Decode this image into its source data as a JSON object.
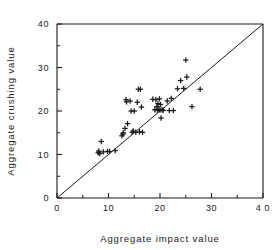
{
  "chart_data": {
    "type": "scatter",
    "title": "",
    "xlabel": "Aggregate  impact  value",
    "ylabel": "Aggregate  crushing  value",
    "xlim": [
      0,
      40
    ],
    "ylim": [
      0,
      40
    ],
    "xticks": [
      0,
      10,
      20,
      30,
      40
    ],
    "yticks": [
      0,
      10,
      20,
      30,
      40
    ],
    "xtick_labels": [
      "0",
      "10",
      "20",
      "30",
      "4 0"
    ],
    "ytick_labels": [
      "0",
      "10",
      "20",
      "30",
      "40"
    ],
    "minor_ticks": true,
    "minor_tick_step": 5,
    "grid": false,
    "legend": null,
    "marker": "plus",
    "marker_color": "#1a1a1a",
    "reference_line": {
      "name": "line-of-equality",
      "from": [
        0,
        0
      ],
      "to": [
        40,
        40
      ],
      "color": "#1a1a1a",
      "width": 1
    },
    "points": [
      [
        8.0,
        10.4
      ],
      [
        8.1,
        10.8
      ],
      [
        8.3,
        10.2
      ],
      [
        8.6,
        13.0
      ],
      [
        9.0,
        10.6
      ],
      [
        9.8,
        10.7
      ],
      [
        10.2,
        10.7
      ],
      [
        11.3,
        10.9
      ],
      [
        12.6,
        14.3
      ],
      [
        12.8,
        14.7
      ],
      [
        12.9,
        15.0
      ],
      [
        13.2,
        16.0
      ],
      [
        13.4,
        22.6
      ],
      [
        13.5,
        22.1
      ],
      [
        13.7,
        17.1
      ],
      [
        14.2,
        22.3
      ],
      [
        14.4,
        20.0
      ],
      [
        14.6,
        15.1
      ],
      [
        14.8,
        15.4
      ],
      [
        15.0,
        20.0
      ],
      [
        15.3,
        15.1
      ],
      [
        15.6,
        22.0
      ],
      [
        15.8,
        25.0
      ],
      [
        16.0,
        15.2
      ],
      [
        16.2,
        25.0
      ],
      [
        16.4,
        20.9
      ],
      [
        16.6,
        15.1
      ],
      [
        18.6,
        22.7
      ],
      [
        19.0,
        20.3
      ],
      [
        19.2,
        22.6
      ],
      [
        19.4,
        21.0
      ],
      [
        19.5,
        20.2
      ],
      [
        19.6,
        21.7
      ],
      [
        19.8,
        20.4
      ],
      [
        19.9,
        22.8
      ],
      [
        20.0,
        20.2
      ],
      [
        20.1,
        21.5
      ],
      [
        20.2,
        18.4
      ],
      [
        20.4,
        20.3
      ],
      [
        20.6,
        20.1
      ],
      [
        21.4,
        22.3
      ],
      [
        21.8,
        20.1
      ],
      [
        22.2,
        22.9
      ],
      [
        22.6,
        20.1
      ],
      [
        23.4,
        25.1
      ],
      [
        24.0,
        27.0
      ],
      [
        24.6,
        25.2
      ],
      [
        25.0,
        31.7
      ],
      [
        25.2,
        27.8
      ],
      [
        26.2,
        21.0
      ],
      [
        27.8,
        25.0
      ]
    ]
  },
  "axes": {
    "x_title": "Aggregate  impact  value",
    "y_title": "Aggregate  crushing  value"
  }
}
